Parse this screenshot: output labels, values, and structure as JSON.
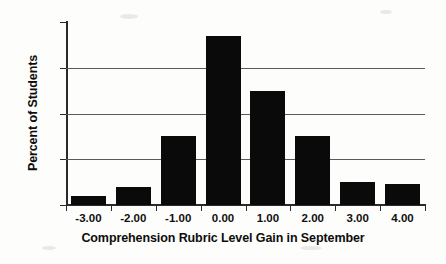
{
  "chart_data": {
    "type": "bar",
    "title": "",
    "xlabel": "Comprehension Rubric Level Gain in September",
    "ylabel": "Percent of Students",
    "categories": [
      "-3.00",
      "-2.00",
      "-1.00",
      "0.00",
      "1.00",
      "2.00",
      "3.00",
      "4.00"
    ],
    "values": [
      2,
      4,
      15,
      37,
      25,
      15,
      5,
      4.5
    ],
    "ylim": [
      0,
      40
    ],
    "yticks": [
      0,
      10,
      20,
      30,
      40
    ],
    "ytick_labels": [
      "0",
      "10",
      "20",
      "30",
      "40"
    ],
    "grid": "horizontal",
    "legend": "none",
    "bar_color": "#0a0a0a",
    "axis_color": "#2a2a2a",
    "gridline_color": "#5a5a5a",
    "background_color": "#fdfdfc"
  }
}
